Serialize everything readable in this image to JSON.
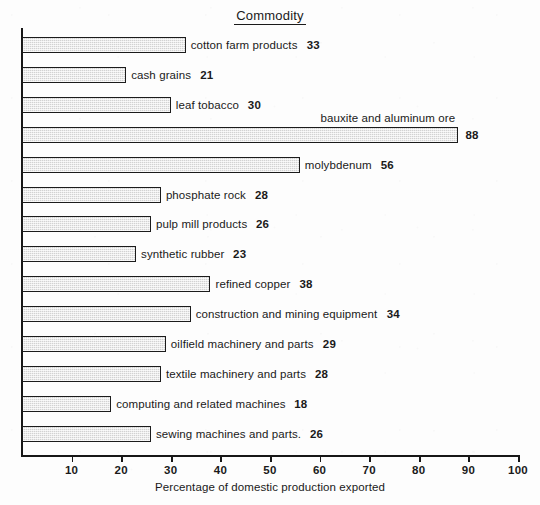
{
  "chart_data": {
    "type": "bar",
    "orientation": "horizontal",
    "title": "Commodity",
    "xlabel": "Percentage of domestic production exported",
    "ylabel": "",
    "xlim": [
      0,
      100
    ],
    "grid": false,
    "legend": null,
    "xticks": [
      10,
      20,
      30,
      40,
      50,
      60,
      70,
      80,
      90,
      100
    ],
    "categories": [
      "cotton farm products",
      "cash grains",
      "leaf tobacco",
      "bauxite and aluminum ore",
      "molybdenum",
      "phosphate rock",
      "pulp mill products",
      "synthetic rubber",
      "refined copper",
      "construction and mining equipment",
      "oilfield machinery and parts",
      "textile machinery and parts",
      "computing and related machines",
      "sewing machines and parts."
    ],
    "values": [
      33,
      21,
      30,
      88,
      56,
      28,
      26,
      23,
      38,
      34,
      29,
      28,
      18,
      26
    ],
    "bars": [
      {
        "label": "cotton farm products",
        "value": 33,
        "value_text": "33",
        "label_above": false
      },
      {
        "label": "cash grains",
        "value": 21,
        "value_text": "21",
        "label_above": false
      },
      {
        "label": "leaf tobacco",
        "value": 30,
        "value_text": "30",
        "label_above": false
      },
      {
        "label": "bauxite and aluminum ore",
        "value": 88,
        "value_text": "88",
        "label_above": true
      },
      {
        "label": "molybdenum",
        "value": 56,
        "value_text": "56",
        "label_above": false
      },
      {
        "label": "phosphate rock",
        "value": 28,
        "value_text": "28",
        "label_above": false
      },
      {
        "label": "pulp mill products",
        "value": 26,
        "value_text": "26",
        "label_above": false
      },
      {
        "label": "synthetic rubber",
        "value": 23,
        "value_text": "23",
        "label_above": false
      },
      {
        "label": "refined copper",
        "value": 38,
        "value_text": "38",
        "label_above": false
      },
      {
        "label": "construction and mining equipment",
        "value": 34,
        "value_text": "34",
        "label_above": false
      },
      {
        "label": "oilfield machinery and parts",
        "value": 29,
        "value_text": "29",
        "label_above": false
      },
      {
        "label": "textile machinery and parts",
        "value": 28,
        "value_text": "28",
        "label_above": false
      },
      {
        "label": "computing and related machines",
        "value": 18,
        "value_text": "18",
        "label_above": false
      },
      {
        "label": "sewing machines and parts.",
        "value": 26,
        "value_text": "26",
        "label_above": false
      }
    ],
    "colors": {
      "bar_fill": "#d2d2d2",
      "bar_stroke": "#1c1c1c",
      "axis": "#171717",
      "text": "#1a1a1a",
      "background": "#fdfdfd"
    }
  }
}
